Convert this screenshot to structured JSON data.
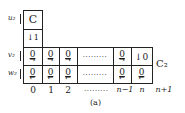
{
  "figure": {
    "caption": "(a)",
    "right_label": "C₂",
    "top_cell_label": "C",
    "top_cell_below": "↓1",
    "row_labels": [
      {
        "id": "u",
        "text": "u₂"
      },
      {
        "id": "v",
        "text": "v₂"
      },
      {
        "id": "w",
        "text": "w₂"
      }
    ],
    "row_v": [
      {
        "value": "0",
        "arrow": "→"
      },
      {
        "value": "0",
        "arrow": "→"
      },
      {
        "value": "0",
        "arrow": "→"
      },
      {
        "value": "·········",
        "arrow": ""
      },
      {
        "value": "0",
        "arrow": "→"
      },
      {
        "value": "↓0",
        "arrow": ""
      }
    ],
    "row_w": [
      {
        "value": "0",
        "arrow": "←"
      },
      {
        "value": "0",
        "arrow": "←"
      },
      {
        "value": "0",
        "arrow": "←"
      },
      {
        "value": "·········",
        "arrow": ""
      },
      {
        "value": "0",
        "arrow": "←"
      },
      {
        "value": "0",
        "arrow": "←"
      }
    ],
    "column_indices": [
      "0",
      "1",
      "2",
      "·········",
      "n−1",
      "n",
      "n+1"
    ]
  }
}
